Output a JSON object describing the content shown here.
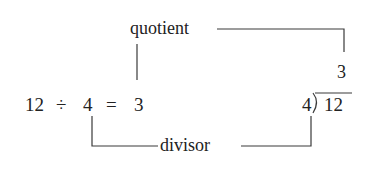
{
  "diagram": {
    "title": "",
    "equation": {
      "dividend": "12",
      "operator": "÷",
      "divisor": "4",
      "equals": "=",
      "quotient": "3",
      "text": "12 ÷ 4 = 3"
    },
    "long_division": {
      "quotient": "3",
      "divisor": "4",
      "bracket": ")",
      "dividend": "12"
    },
    "labels": {
      "quotient": "quotient",
      "divisor": "divisor"
    },
    "connectors": [
      {
        "from": "quotient-label",
        "to": "equation-quotient-3",
        "description": "vertical line from the quotient label down to 3 in the equation"
      },
      {
        "from": "quotient-label",
        "to": "long-division-quotient-3",
        "description": "line running right from the quotient label, then down to 3 above the long division"
      },
      {
        "from": "equation-divisor-4",
        "to": "divisor-label",
        "description": "line from the 4 in the equation down, then right to the divisor label"
      },
      {
        "from": "divisor-label",
        "to": "long-division-divisor-4",
        "description": "line running right from the divisor label, then up to 4 in the long division"
      }
    ],
    "colors": {
      "text": "#222222",
      "lines": "#3a3a3a",
      "background": "#ffffff"
    }
  }
}
